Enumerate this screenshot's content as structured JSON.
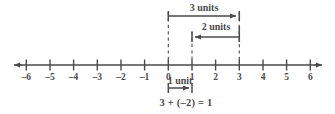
{
  "figure": {
    "colors": {
      "ink": "#4a4a4a",
      "background": "#ffffff"
    }
  },
  "number_line": {
    "axis_label_left_arrow": "left-arrow",
    "axis_label_right_arrow": "right-arrow",
    "ticks": [
      {
        "value": -6,
        "label": "–6"
      },
      {
        "value": -5,
        "label": "–5"
      },
      {
        "value": -4,
        "label": "–4"
      },
      {
        "value": -3,
        "label": "–3"
      },
      {
        "value": -2,
        "label": "–2"
      },
      {
        "value": -1,
        "label": "–1"
      },
      {
        "value": 0,
        "label": "0"
      },
      {
        "value": 1,
        "label": "1"
      },
      {
        "value": 2,
        "label": "2"
      },
      {
        "value": 3,
        "label": "3"
      },
      {
        "value": 4,
        "label": "4"
      },
      {
        "value": 5,
        "label": "5"
      },
      {
        "value": 6,
        "label": "6"
      }
    ],
    "range": [
      -6,
      6
    ]
  },
  "annotations": {
    "jump_3": {
      "label": "3 units",
      "from": 0,
      "to": 3,
      "direction": "right"
    },
    "jump_2": {
      "label": "2 units",
      "from": 3,
      "to": 1,
      "direction": "left"
    },
    "jump_1": {
      "label": "1 unit",
      "from": 0,
      "to": 1,
      "direction": "right"
    },
    "equation": "3 + (–2) = 1"
  },
  "guides": [
    {
      "at": 0,
      "style": "dashed"
    },
    {
      "at": 1,
      "style": "dashed"
    },
    {
      "at": 3,
      "style": "dashed"
    }
  ]
}
